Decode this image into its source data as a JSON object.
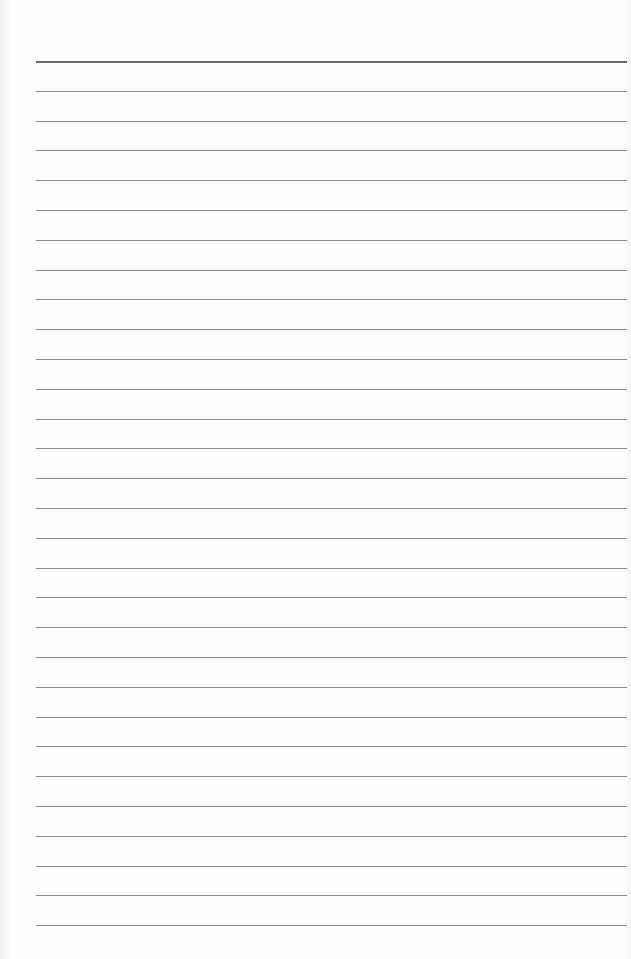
{
  "page": {
    "type": "lined-paper",
    "line_count": 30,
    "first_line_y": 61,
    "line_spacing": 29.8,
    "line_left": 36,
    "line_width": 591,
    "colors": {
      "paper": "#fdfdfd",
      "header_line": "#6e6e6e",
      "rule_line": "#8a8a8a"
    }
  }
}
